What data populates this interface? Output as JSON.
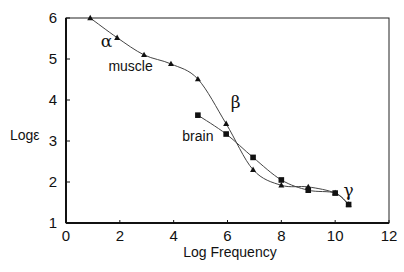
{
  "chart_data": {
    "type": "line",
    "title": "",
    "xlabel": "Log Frequency",
    "ylabel": "Logε",
    "xlim": [
      0,
      12
    ],
    "ylim": [
      1,
      6
    ],
    "xticks": [
      "0",
      "2",
      "4",
      "6",
      "8",
      "10",
      "12"
    ],
    "yticks": [
      "1",
      "2",
      "3",
      "4",
      "5",
      "6"
    ],
    "grid": false,
    "legend": "none (inline labels)",
    "series": [
      {
        "name": "muscle",
        "marker": "triangle",
        "x": [
          0.9,
          1.9,
          2.9,
          3.9,
          4.9,
          5.95,
          6.95,
          8.0,
          9.0,
          10.0,
          10.5
        ],
        "y": [
          6.0,
          5.52,
          5.1,
          4.88,
          4.51,
          3.42,
          2.3,
          1.92,
          1.88,
          1.73,
          1.45
        ]
      },
      {
        "name": "brain",
        "marker": "square",
        "x": [
          4.9,
          5.95,
          6.95,
          8.0,
          9.0,
          10.0,
          10.5
        ],
        "y": [
          3.63,
          3.17,
          2.6,
          2.05,
          1.8,
          1.73,
          1.45
        ]
      }
    ],
    "annotations": [
      {
        "text": "α",
        "x": 1.5,
        "y": 5.3
      },
      {
        "text": "muscle",
        "x": 2.4,
        "y": 4.7
      },
      {
        "text": "β",
        "x": 6.3,
        "y": 3.8
      },
      {
        "text": "brain",
        "x": 4.9,
        "y": 3.0
      },
      {
        "text": "γ",
        "x": 10.5,
        "y": 1.65
      }
    ]
  }
}
